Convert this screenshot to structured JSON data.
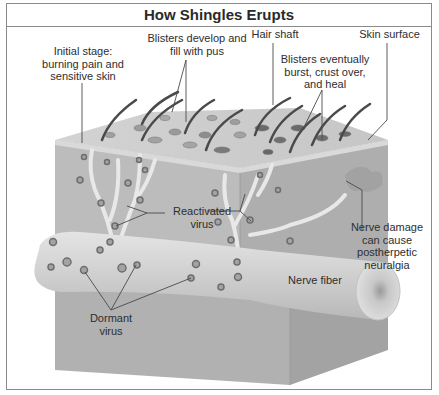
{
  "title": "How Shingles Erupts",
  "labels": {
    "initial_stage": [
      "Initial stage:",
      "burning pain and",
      "sensitive skin"
    ],
    "blisters_develop": [
      "Blisters develop and",
      "fill with pus"
    ],
    "hair_shaft": "Hair shaft",
    "blisters_heal": [
      "Blisters eventually",
      "burst, crust over,",
      "and heal"
    ],
    "skin_surface": "Skin surface",
    "reactivated_virus": [
      "Reactivated",
      "virus"
    ],
    "nerve_damage": [
      "Nerve damage",
      "can cause",
      "postherpetic",
      "neuralgia"
    ],
    "nerve_fiber": "Nerve fiber",
    "dormant_virus": [
      "Dormant",
      "virus"
    ]
  },
  "colors": {
    "border": "#8a8a8a",
    "skin_top": "#c9c9c9",
    "block_front": "#b3b3b3",
    "block_side": "#a6a6a6",
    "nerve": "#d4d4d4",
    "hair": "#4a4a4a",
    "virus": "#7a7a7a",
    "leader_line": "#4a4a4a"
  }
}
